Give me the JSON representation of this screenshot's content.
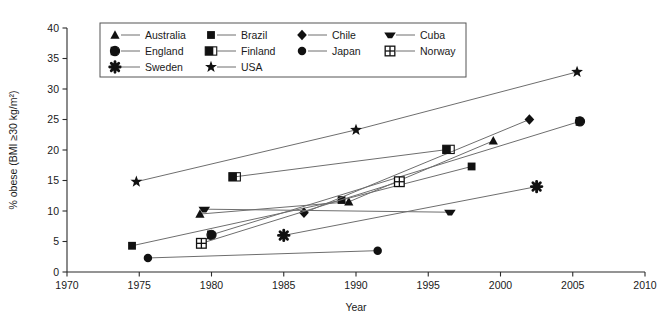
{
  "chart_data": {
    "type": "line",
    "title": "",
    "xlabel": "Year",
    "ylabel": "% obese (BMI ≥30 kg/m²)",
    "xlim": [
      1970,
      2010
    ],
    "ylim": [
      0,
      40
    ],
    "xticks": [
      "1970",
      "1975",
      "1980",
      "1985",
      "1990",
      "1995",
      "2000",
      "2005",
      "2010"
    ],
    "yticks": [
      "0",
      "5",
      "10",
      "15",
      "20",
      "25",
      "30",
      "35",
      "40"
    ],
    "grid": false,
    "legend_position": "top-left-inside",
    "series": [
      {
        "name": "Australia",
        "marker": "triangle",
        "x": [
          1979.2,
          1989.5,
          1999.5
        ],
        "y": [
          9.5,
          11.5,
          21.5
        ]
      },
      {
        "name": "Brazil",
        "marker": "square",
        "x": [
          1974.5,
          1989.0,
          1998.0
        ],
        "y": [
          4.3,
          11.8,
          17.3
        ]
      },
      {
        "name": "Chile",
        "marker": "diamond",
        "x": [
          1986.4,
          2002.0
        ],
        "y": [
          9.7,
          25.0
        ]
      },
      {
        "name": "Cuba",
        "marker": "oval",
        "x": [
          1979.5,
          1996.5
        ],
        "y": [
          10.3,
          9.8
        ]
      },
      {
        "name": "England",
        "marker": "circle-half",
        "x": [
          1980.0,
          2005.5
        ],
        "y": [
          6.1,
          24.7
        ]
      },
      {
        "name": "Finland",
        "marker": "square-half",
        "x": [
          1981.6,
          1996.4
        ],
        "y": [
          15.6,
          20.1
        ]
      },
      {
        "name": "Japan",
        "marker": "circle",
        "x": [
          1975.6,
          1991.5
        ],
        "y": [
          2.3,
          3.5
        ]
      },
      {
        "name": "Norway",
        "marker": "square-grid",
        "x": [
          1979.3,
          1993.0
        ],
        "y": [
          4.7,
          14.8
        ]
      },
      {
        "name": "Sweden",
        "marker": "asterisk",
        "x": [
          1985.0,
          2002.5
        ],
        "y": [
          6.0,
          14.0
        ]
      },
      {
        "name": "USA",
        "marker": "star",
        "x": [
          1974.8,
          1990.0,
          2005.3
        ],
        "y": [
          14.8,
          23.3,
          32.8
        ]
      }
    ]
  },
  "legend": {
    "columns": [
      [
        {
          "label": "Australia",
          "marker": "triangle"
        },
        {
          "label": "England",
          "marker": "circle-half"
        },
        {
          "label": "Sweden",
          "marker": "asterisk"
        }
      ],
      [
        {
          "label": "Brazil",
          "marker": "square"
        },
        {
          "label": "Finland",
          "marker": "square-half"
        },
        {
          "label": "USA",
          "marker": "star"
        }
      ],
      [
        {
          "label": "Chile",
          "marker": "diamond"
        },
        {
          "label": "Japan",
          "marker": "circle"
        }
      ],
      [
        {
          "label": "Cuba",
          "marker": "oval"
        },
        {
          "label": "Norway",
          "marker": "square-grid"
        }
      ]
    ]
  },
  "colors": {
    "line": "#6e6e6e",
    "marker": "#111111",
    "axis": "#2b2b2b",
    "background": "#ffffff"
  }
}
